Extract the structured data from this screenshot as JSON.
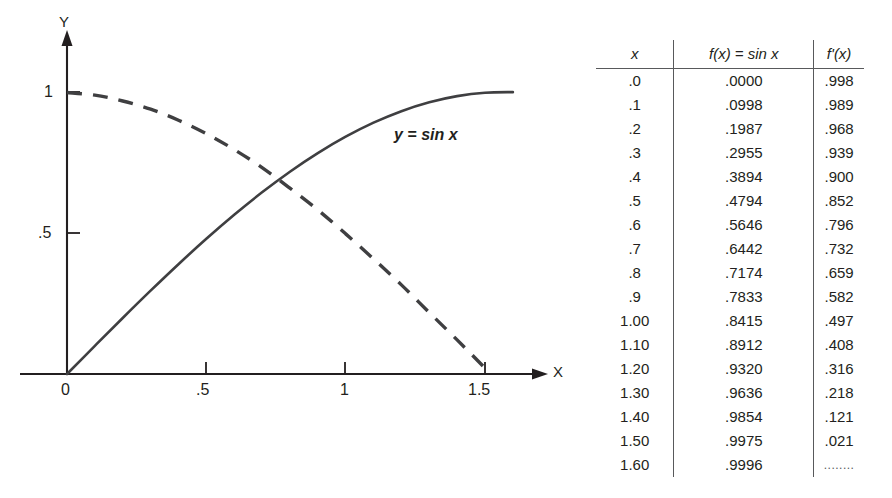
{
  "chart_data": {
    "type": "line",
    "title": "",
    "xlabel": "X",
    "ylabel": "Y",
    "xlim": [
      0,
      1.7
    ],
    "ylim": [
      0,
      1.12
    ],
    "grid": false,
    "legend_position": "inline-annotation",
    "annotations": [
      {
        "text": "y = sin x",
        "x": 1.15,
        "y": 0.93
      }
    ],
    "x_ticks": [
      "0",
      ".5",
      "1",
      "1.5"
    ],
    "x_tick_values": [
      0,
      0.5,
      1,
      1.5
    ],
    "y_ticks": [
      ".5",
      "1"
    ],
    "y_tick_values": [
      0.5,
      1
    ],
    "series": [
      {
        "name": "y = sin x",
        "style": "solid",
        "color": "#3f3f41",
        "x": [
          0.0,
          0.1,
          0.2,
          0.3,
          0.4,
          0.5,
          0.6,
          0.7,
          0.8,
          0.9,
          1.0,
          1.1,
          1.2,
          1.3,
          1.4,
          1.5,
          1.6
        ],
        "values": [
          0.0,
          0.0998,
          0.1987,
          0.2955,
          0.3894,
          0.4794,
          0.5646,
          0.6442,
          0.7174,
          0.7833,
          0.8415,
          0.8912,
          0.932,
          0.9636,
          0.9854,
          0.9975,
          0.9996
        ]
      },
      {
        "name": "y = cos x",
        "style": "dashed",
        "color": "#3f3f41",
        "x": [
          0.0,
          0.1,
          0.2,
          0.3,
          0.4,
          0.5,
          0.6,
          0.7,
          0.8,
          0.9,
          1.0,
          1.1,
          1.2,
          1.3,
          1.4,
          1.5
        ],
        "values": [
          0.998,
          0.989,
          0.968,
          0.939,
          0.9,
          0.852,
          0.796,
          0.732,
          0.659,
          0.582,
          0.497,
          0.408,
          0.316,
          0.218,
          0.121,
          0.021
        ]
      }
    ]
  },
  "graph": {
    "y_axis_label": "Y",
    "x_axis_label": "X",
    "y_tick_1": "1",
    "y_tick_05": ".5",
    "x_tick_0": "0",
    "x_tick_05": ".5",
    "x_tick_1": "1",
    "x_tick_15": "1.5",
    "curve_label": "y = sin x"
  },
  "table": {
    "headers": {
      "x": "x",
      "fx": "f(x) = sin x",
      "dfx": "f'(x)"
    },
    "rows": [
      {
        "x": ".0",
        "fx": ".0000",
        "dfx": ".998"
      },
      {
        "x": ".1",
        "fx": ".0998",
        "dfx": ".989"
      },
      {
        "x": ".2",
        "fx": ".1987",
        "dfx": ".968"
      },
      {
        "x": ".3",
        "fx": ".2955",
        "dfx": ".939"
      },
      {
        "x": ".4",
        "fx": ".3894",
        "dfx": ".900"
      },
      {
        "x": ".5",
        "fx": ".4794",
        "dfx": ".852"
      },
      {
        "x": ".6",
        "fx": ".5646",
        "dfx": ".796"
      },
      {
        "x": ".7",
        "fx": ".6442",
        "dfx": ".732"
      },
      {
        "x": ".8",
        "fx": ".7174",
        "dfx": ".659"
      },
      {
        "x": ".9",
        "fx": ".7833",
        "dfx": ".582"
      },
      {
        "x": "1.00",
        "fx": ".8415",
        "dfx": ".497"
      },
      {
        "x": "1.10",
        "fx": ".8912",
        "dfx": ".408"
      },
      {
        "x": "1.20",
        "fx": ".9320",
        "dfx": ".316"
      },
      {
        "x": "1.30",
        "fx": ".9636",
        "dfx": ".218"
      },
      {
        "x": "1.40",
        "fx": ".9854",
        "dfx": ".121"
      },
      {
        "x": "1.50",
        "fx": ".9975",
        "dfx": ".021"
      },
      {
        "x": "1.60",
        "fx": ".9996",
        "dfx": "........"
      }
    ]
  },
  "colors": {
    "ink": "#231f20",
    "rule": "#58595b",
    "curve": "#3f3f41"
  }
}
